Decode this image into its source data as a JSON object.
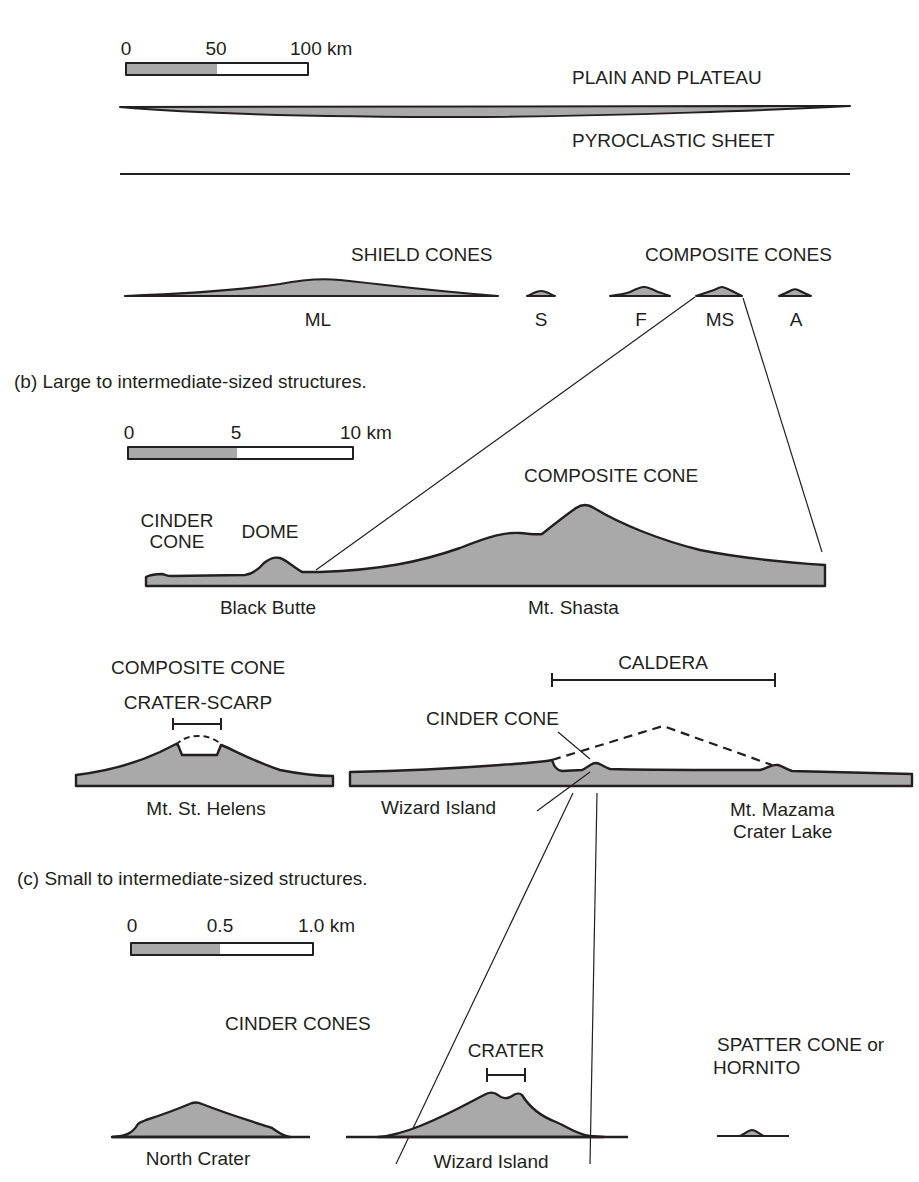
{
  "figure": {
    "colors": {
      "fill": "#a9a9a9",
      "stroke": "#231f20",
      "background": "#ffffff"
    },
    "section_a": {
      "scale_bar": {
        "ticks": [
          "0",
          "50",
          "100 km"
        ]
      },
      "labels": {
        "plain_and_plateau": "PLAIN AND PLATEAU",
        "pyroclastic_sheet": "PYROCLASTIC SHEET",
        "shield_cones": "SHIELD CONES",
        "composite_cones": "COMPOSITE CONES"
      },
      "cones": [
        {
          "id": "ML",
          "label": "ML",
          "type": "shield"
        },
        {
          "id": "S",
          "label": "S",
          "type": "shield"
        },
        {
          "id": "F",
          "label": "F",
          "type": "composite"
        },
        {
          "id": "MS",
          "label": "MS",
          "type": "composite"
        },
        {
          "id": "A",
          "label": "A",
          "type": "composite"
        }
      ]
    },
    "section_b": {
      "caption": "(b) Large to intermediate-sized structures.",
      "scale_bar": {
        "ticks": [
          "0",
          "5",
          "10 km"
        ]
      },
      "labels": {
        "cinder_cone": [
          "CINDER",
          "CONE"
        ],
        "dome": "DOME",
        "composite_cone": "COMPOSITE CONE",
        "black_butte": "Black Butte",
        "mt_shasta": "Mt. Shasta",
        "composite_cone_helens": "COMPOSITE CONE",
        "crater_scarp": "CRATER-SCARP",
        "mt_st_helens": "Mt. St. Helens",
        "caldera": "CALDERA",
        "cinder_cone_wizard": "CINDER CONE",
        "wizard_island": "Wizard Island",
        "mt_mazama": "Mt. Mazama",
        "crater_lake": "Crater Lake"
      }
    },
    "section_c": {
      "caption": "(c) Small to intermediate-sized structures.",
      "scale_bar": {
        "ticks": [
          "0",
          "0.5",
          "1.0 km"
        ]
      },
      "labels": {
        "cinder_cones": "CINDER CONES",
        "crater": "CRATER",
        "spatter_cone": "SPATTER CONE or",
        "hornito": "HORNITO",
        "north_crater": "North Crater",
        "wizard_island": "Wizard Island"
      }
    }
  }
}
